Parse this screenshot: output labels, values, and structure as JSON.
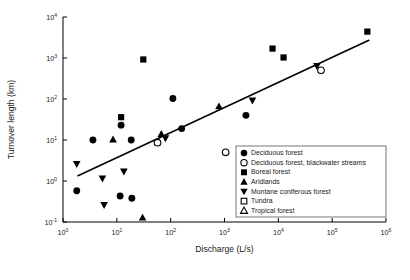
{
  "chart_data": {
    "type": "scatter",
    "title": "",
    "xlabel": "Discharge (L/s)",
    "ylabel": "Turnover length (km)",
    "xscale": "log",
    "yscale": "log",
    "xlim": [
      1,
      1000000
    ],
    "ylim": [
      0.1,
      10000
    ],
    "grid": false,
    "legend_position": "bottom-right",
    "xticks": [
      {
        "value": 1,
        "label": "10",
        "exp": "0"
      },
      {
        "value": 10,
        "label": "10",
        "exp": "1"
      },
      {
        "value": 100,
        "label": "10",
        "exp": "2"
      },
      {
        "value": 1000,
        "label": "10",
        "exp": "3"
      },
      {
        "value": 10000,
        "label": "10",
        "exp": "4"
      },
      {
        "value": 100000,
        "label": "10",
        "exp": "5"
      },
      {
        "value": 1000000,
        "label": "10",
        "exp": "6"
      }
    ],
    "yticks": [
      {
        "value": 0.1,
        "label": "10",
        "exp": "-1"
      },
      {
        "value": 1,
        "label": "10",
        "exp": "0"
      },
      {
        "value": 10,
        "label": "10",
        "exp": "1"
      },
      {
        "value": 100,
        "label": "10",
        "exp": "2"
      },
      {
        "value": 1000,
        "label": "10",
        "exp": "3"
      },
      {
        "value": 10000,
        "label": "10",
        "exp": "4"
      }
    ],
    "trend_line": {
      "x_start": 1.9,
      "y_start": 1.35,
      "x_end": 480000,
      "y_end": 2700,
      "color": "#000000"
    },
    "series": [
      {
        "name": "Deciduous forest",
        "marker": "circle-filled",
        "points": [
          {
            "x": 1.8,
            "y": 0.58
          },
          {
            "x": 3.6,
            "y": 10.0
          },
          {
            "x": 11.5,
            "y": 0.43
          },
          {
            "x": 12.0,
            "y": 23.0
          },
          {
            "x": 18.5,
            "y": 10.0
          },
          {
            "x": 19.0,
            "y": 0.38
          },
          {
            "x": 110,
            "y": 103
          },
          {
            "x": 160,
            "y": 19.0
          },
          {
            "x": 2500,
            "y": 40.0
          }
        ]
      },
      {
        "name": "Deciduous forest, blackwater streams",
        "marker": "circle-open",
        "points": [
          {
            "x": 57,
            "y": 8.6
          },
          {
            "x": 1050,
            "y": 5.0
          },
          {
            "x": 62000,
            "y": 500
          }
        ]
      },
      {
        "name": "Boreal forest",
        "marker": "square-filled",
        "points": [
          {
            "x": 12.0,
            "y": 36.0
          },
          {
            "x": 31,
            "y": 920
          },
          {
            "x": 7800,
            "y": 1700
          },
          {
            "x": 12500,
            "y": 1030
          },
          {
            "x": 450000,
            "y": 4400
          }
        ]
      },
      {
        "name": "Aridlands",
        "marker": "triangle-up-filled",
        "points": [
          {
            "x": 8.5,
            "y": 10.3
          },
          {
            "x": 30,
            "y": 0.128
          },
          {
            "x": 67,
            "y": 14.0
          },
          {
            "x": 790,
            "y": 66.0
          }
        ]
      },
      {
        "name": "Montane coniferous forest",
        "marker": "triangle-down-filled",
        "points": [
          {
            "x": 1.8,
            "y": 2.6
          },
          {
            "x": 5.4,
            "y": 1.15
          },
          {
            "x": 5.8,
            "y": 0.26
          },
          {
            "x": 13.5,
            "y": 1.7
          },
          {
            "x": 80,
            "y": 11.0
          },
          {
            "x": 3300,
            "y": 92.0
          },
          {
            "x": 52000,
            "y": 640
          }
        ]
      },
      {
        "name": "Tundra",
        "marker": "square-open",
        "points": []
      },
      {
        "name": "Tropical forest",
        "marker": "triangle-up-open",
        "points": []
      }
    ]
  }
}
